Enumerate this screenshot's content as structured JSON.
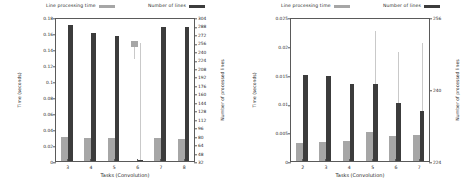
{
  "figure": {
    "panels": [
      {
        "id": "left-panel",
        "legend": [
          {
            "label": "Line processing time",
            "swatch": "light",
            "color": "#a6a6a6"
          },
          {
            "label": "Number of lines",
            "swatch": "dark",
            "color": "#3c3c3c"
          }
        ],
        "chart_data": {
          "type": "bar",
          "title": "",
          "xlabel": "Tasks (Convolution)",
          "ylabel": "Time (seconds)",
          "y2label": "Number of processed lines",
          "categories": [
            "3",
            "4",
            "5",
            "6",
            "7",
            "8"
          ],
          "ylim": [
            0,
            0.18
          ],
          "yticks": [
            "0",
            "0.02",
            "0.04",
            "0.06",
            "0.08",
            "0.1",
            "0.12",
            "0.14",
            "0.16",
            "0.18"
          ],
          "y2lim": [
            32,
            304
          ],
          "y2ticks": [
            "32",
            "48",
            "64",
            "80",
            "96",
            "112",
            "128",
            "144",
            "160",
            "176",
            "192",
            "208",
            "224",
            "240",
            "256",
            "272",
            "288",
            "304"
          ],
          "grid": false,
          "legend_position": "top",
          "series": [
            {
              "name": "Line processing time",
              "axis": "left",
              "color": "#a6a6a6",
              "values": [
                0.03,
                0.029,
                0.029,
                0.15,
                0.029,
                0.028
              ],
              "floating": [
                false,
                false,
                false,
                true,
                false,
                false
              ],
              "float_low": [
                0,
                0,
                0,
                0.143,
                0,
                0
              ],
              "whisker_low": [
                0,
                0,
                0,
                0.128,
                0,
                0
              ]
            },
            {
              "name": "Number of lines",
              "axis": "right",
              "color": "#3c3c3c",
              "values": [
                288,
                272,
                266,
                33,
                286,
                286
              ],
              "time_equivalent": [
                0.17,
                0.16,
                0.156,
                0.001,
                0.168,
                0.168
              ]
            }
          ],
          "error_bars": {
            "series": "Number of lines",
            "color": "#c9c9c9",
            "upper_time": [
              0.126,
              0.132,
              0.15,
              0.148,
              0.126,
              0.106
            ]
          }
        }
      },
      {
        "id": "right-panel",
        "legend": [
          {
            "label": "Line processing time",
            "swatch": "light",
            "color": "#a6a6a6"
          },
          {
            "label": "Number of lines",
            "swatch": "dark",
            "color": "#3c3c3c"
          }
        ],
        "chart_data": {
          "type": "bar",
          "title": "",
          "xlabel": "Tasks (Convolution)",
          "ylabel": "Time (seconds)",
          "y2label": "Number of processed lines",
          "categories": [
            "2",
            "3",
            "4",
            "5",
            "6",
            "7"
          ],
          "ylim": [
            0,
            0.025
          ],
          "yticks": [
            "0",
            "0.005",
            "0.01",
            "0.015",
            "0.02",
            "0.025"
          ],
          "y2lim": [
            224,
            256
          ],
          "y2ticks": [
            "224",
            "240",
            "256"
          ],
          "grid": false,
          "legend_position": "top",
          "series": [
            {
              "name": "Line processing time",
              "axis": "left",
              "color": "#a6a6a6",
              "values": [
                0.0032,
                0.0033,
                0.0035,
                0.005,
                0.0043,
                0.0046
              ]
            },
            {
              "name": "Number of lines",
              "axis": "right",
              "color": "#3c3c3c",
              "values": [
                243,
                243,
                241,
                241,
                237,
                235
              ],
              "time_equivalent": [
                0.0149,
                0.0148,
                0.0133,
                0.0133,
                0.0101,
                0.0086
              ]
            }
          ],
          "error_bars": {
            "series": "Number of lines",
            "color": "#c9c9c9",
            "upper_time": [
              0.0,
              0.0,
              0.0,
              0.0225,
              0.019,
              0.0205
            ]
          }
        }
      }
    ]
  }
}
